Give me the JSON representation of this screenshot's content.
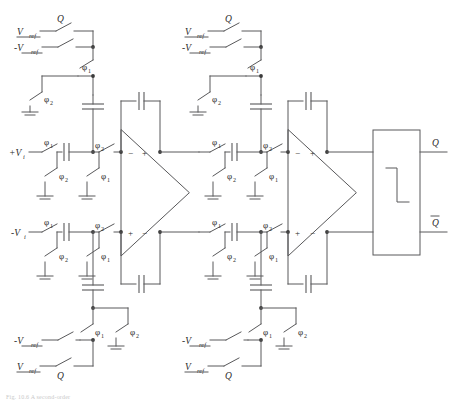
{
  "figure": {
    "caption": "Fig. 10.6 A second-order"
  },
  "signals": {
    "vin_plus": "+V",
    "vin_plus_sub": "i",
    "vin_minus": "-V",
    "vin_minus_sub": "i",
    "vref": "V",
    "vref_sub": "ref",
    "vref_neg": "-V",
    "vref_neg_sub": "ref",
    "q": "Q",
    "qbar": "Q",
    "phi1": "φ",
    "phi1_sub": "1",
    "phi2": "φ",
    "phi2_sub": "2",
    "opamp_minus": "−",
    "opamp_plus": "+"
  },
  "stage1": {
    "name": "integrator-1",
    "top_ref_switch_label": "Q",
    "top_ref_source": "V",
    "top_ref_source_sub": "ref",
    "bottom_ref_source": "-V",
    "bottom_ref_source_sub": "ref",
    "clock_a": "φ",
    "clock_a_sub": "1",
    "clock_b": "φ",
    "clock_b_sub": "2"
  },
  "stage2": {
    "name": "integrator-2",
    "top_ref_switch_label": "Q",
    "clock_a": "φ",
    "clock_a_sub": "1",
    "clock_b": "φ",
    "clock_b_sub": "2"
  },
  "latch": {
    "name": "comparator-latch",
    "out_q": "Q",
    "out_qbar": "Q",
    "symbol": "step-waveform"
  },
  "colors": {
    "wire": "#58585a",
    "text": "#2b2b2b",
    "background": "#ffffff"
  }
}
